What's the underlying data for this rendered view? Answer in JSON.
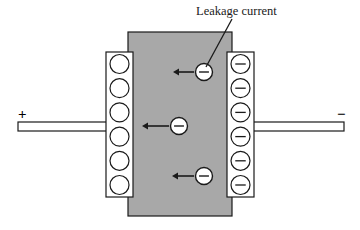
{
  "figure": {
    "title_label": "Leakage current",
    "background_color": "#ffffff",
    "dielectric_color": "#a8a8a8",
    "outline_color": "#1a1a1a",
    "terminals": {
      "positive_sign": "+",
      "negative_sign": "−"
    },
    "electrode_left": {
      "name": "positive-electrode-plate",
      "charge_symbol": "",
      "charge_count": 6,
      "fill_color": "#ffffff"
    },
    "electrode_right": {
      "name": "negative-electrode-plate",
      "charge_symbol": "−",
      "charge_count": 6,
      "fill_color": "#ffffff"
    },
    "leakage_electrons": [
      {
        "id": "electron-top",
        "symbol": "−",
        "cx": 204,
        "cy": 72,
        "arrow_from_x": 194,
        "arrow_to_x": 173,
        "arrow_y": 72
      },
      {
        "id": "electron-middle",
        "symbol": "−",
        "cx": 179,
        "cy": 126,
        "arrow_from_x": 169,
        "arrow_to_x": 142,
        "arrow_y": 126
      },
      {
        "id": "electron-bottom",
        "symbol": "−",
        "cx": 204,
        "cy": 176,
        "arrow_from_x": 194,
        "arrow_to_x": 172,
        "arrow_y": 176
      }
    ],
    "leader_line": {
      "name": "leakage-current-leader-line",
      "x1": 232,
      "y1": 19,
      "x2": 206,
      "y2": 67
    },
    "geometry": {
      "dielectric": {
        "x": 128,
        "y": 32,
        "w": 104,
        "h": 184
      },
      "plate_left": {
        "x": 106,
        "y": 52,
        "w": 27,
        "h": 145
      },
      "plate_right": {
        "x": 227,
        "y": 52,
        "w": 27,
        "h": 145
      },
      "lead_left": {
        "x": 18,
        "y": 122,
        "w": 90,
        "h": 9
      },
      "lead_right": {
        "x": 252,
        "y": 122,
        "w": 92,
        "h": 9
      },
      "charge_radius": 9.5,
      "electron_radius": 8.5
    }
  }
}
